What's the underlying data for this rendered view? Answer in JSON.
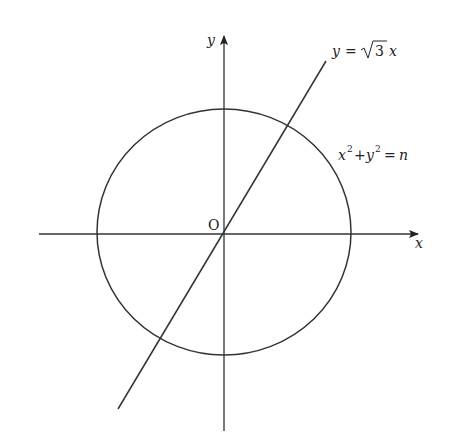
{
  "diagram": {
    "type": "coordinate-geometry",
    "axes": {
      "x_label": "x",
      "y_label": "y",
      "origin_label": "O"
    },
    "curves": [
      {
        "id": "circle",
        "equation_label": {
          "lhs_x": "x",
          "exp1": "2",
          "plus": "+",
          "lhs_y": "y",
          "exp2": "2",
          "eq": "=",
          "rhs": "n"
        }
      },
      {
        "id": "line",
        "equation_label": {
          "lhs": "y",
          "eq": "=",
          "coef": "3",
          "var": "x"
        }
      }
    ],
    "colors": {
      "stroke": "#333333",
      "background": "#ffffff"
    }
  }
}
